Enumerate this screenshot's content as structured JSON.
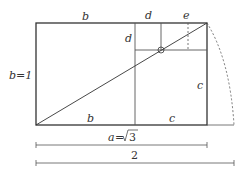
{
  "diagram": {
    "labels": {
      "top_b": "b",
      "top_d": "d",
      "top_e": "e",
      "left_side": "b=1",
      "inner_d": "d",
      "right_c": "c",
      "bottom_b": "b",
      "bottom_c": "c",
      "measure_a_var": "a",
      "measure_a_eq": "=",
      "measure_a_val": "3",
      "measure_2": "2"
    },
    "colors": {
      "stroke": "#333333",
      "dashed": "#555555",
      "background": "#ffffff"
    }
  }
}
